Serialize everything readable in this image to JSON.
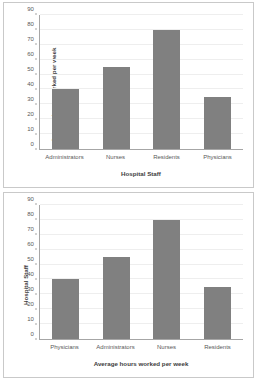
{
  "chart_data": [
    {
      "type": "bar",
      "panel": "top",
      "title": "",
      "categories": [
        "Administrators",
        "Nurses",
        "Residents",
        "Physicians"
      ],
      "values": [
        40,
        55,
        80,
        35
      ],
      "xlabel": "Hospital Staff",
      "ylabel": "Average hours worked per week",
      "ylim": [
        0,
        90
      ],
      "yticks": [
        0,
        10,
        20,
        30,
        40,
        50,
        60,
        70,
        80,
        90
      ],
      "ytick_labels": [
        "0",
        "10",
        "20",
        "30",
        "40",
        "50",
        "60",
        "70",
        "80",
        "90"
      ],
      "grid": true,
      "legend": "none",
      "bar_color": "#808080"
    },
    {
      "type": "bar",
      "panel": "bottom",
      "title": "",
      "categories": [
        "Physicians",
        "Administrators",
        "Nurses",
        "Residents"
      ],
      "values": [
        40,
        55,
        80,
        35
      ],
      "xlabel": "Average hours worked per week",
      "ylabel": "Hospital Staff",
      "ylim": [
        0,
        90
      ],
      "yticks": [
        0,
        10,
        20,
        30,
        40,
        50,
        60,
        70,
        80,
        90
      ],
      "ytick_labels": [
        "0",
        "10",
        "20",
        "30",
        "40",
        "50",
        "60",
        "70",
        "80",
        "90"
      ],
      "grid": true,
      "legend": "none",
      "bar_color": "#808080"
    }
  ]
}
